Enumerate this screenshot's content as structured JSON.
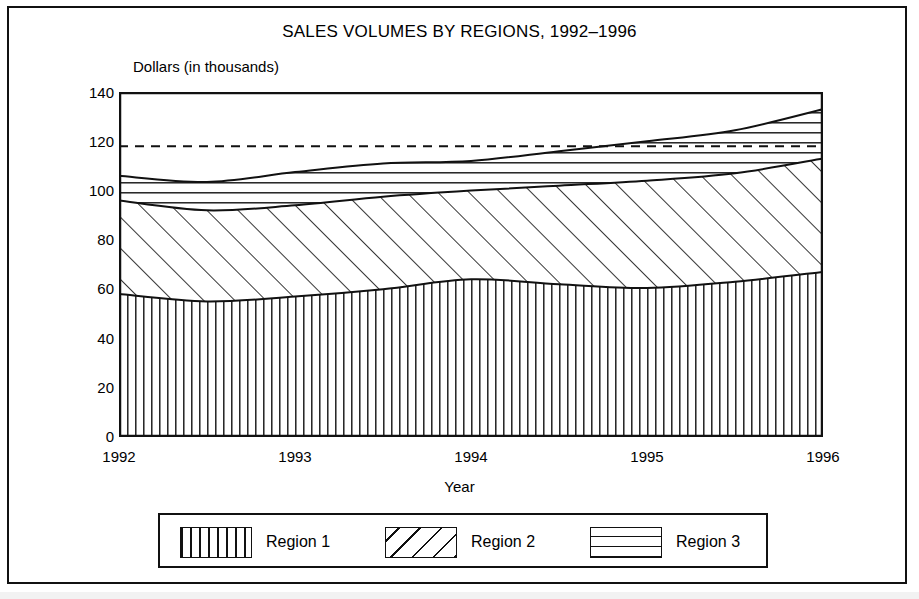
{
  "figure": {
    "title": "SALES VOLUMES BY REGIONS, 1992–1996",
    "y_axis_title": "Dollars (in thousands)",
    "x_axis_title": "Year"
  },
  "legend": {
    "entries": [
      {
        "label": "Region 1",
        "pattern": "vertical-lines"
      },
      {
        "label": "Region 2",
        "pattern": "diagonal-lines"
      },
      {
        "label": "Region 3",
        "pattern": "horizontal-lines"
      }
    ]
  },
  "chart_data": {
    "type": "area",
    "stacked": true,
    "title": "SALES VOLUMES BY REGIONS, 1992–1996",
    "xlabel": "Year",
    "ylabel": "Dollars (in thousands)",
    "xlim": [
      1992,
      1996
    ],
    "ylim": [
      0,
      140
    ],
    "ytick_labels": [
      "0",
      "20",
      "40",
      "60",
      "80",
      "100",
      "120",
      "140"
    ],
    "yticks": [
      0,
      20,
      40,
      60,
      80,
      100,
      120,
      140
    ],
    "xtick_labels": [
      "1992",
      "1993",
      "1994",
      "1995",
      "1996"
    ],
    "xticks": [
      1992,
      1993,
      1994,
      1995,
      1996
    ],
    "grid": false,
    "legend_position": "bottom",
    "x": [
      1992,
      1992.5,
      1993,
      1993.5,
      1994,
      1994.5,
      1995,
      1995.5,
      1996
    ],
    "series": [
      {
        "name": "Region 1",
        "pattern": "vertical-lines",
        "values": [
          58,
          55,
          57,
          60,
          64,
          62,
          60.5,
          63,
          67
        ]
      },
      {
        "name": "Region 2",
        "pattern": "diagonal-lines",
        "values": [
          38,
          37,
          37,
          37.5,
          36,
          40,
          43.5,
          44,
          46
        ]
      },
      {
        "name": "Region 3",
        "pattern": "horizontal-lines",
        "values": [
          10,
          11.5,
          13.5,
          13.5,
          12,
          14,
          16,
          17.5,
          20
        ]
      }
    ],
    "cumulative_totals": {
      "region1_top": [
        58,
        55,
        57,
        60,
        64,
        62,
        60.5,
        63,
        67
      ],
      "region2_top": [
        96,
        92,
        94,
        97.5,
        100,
        102,
        104,
        107,
        113
      ],
      "region3_top": [
        106,
        103.5,
        107.5,
        111,
        112,
        116,
        120,
        124.5,
        133
      ]
    },
    "annotations": [
      {
        "type": "reference-line",
        "style": "dashed",
        "orientation": "horizontal",
        "value": 118
      }
    ]
  }
}
